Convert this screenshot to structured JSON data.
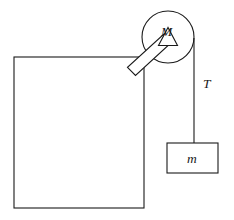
{
  "figure": {
    "kind": "physics-free-body-diagram",
    "background_color": "#ffffff",
    "stroke_color": "#1a1a1a"
  },
  "labels": {
    "pulley_mass": "M",
    "tension": "T",
    "hanging_mass": "m"
  },
  "geometry": {
    "canvas": {
      "width": 234,
      "height": 220
    },
    "large_block": {
      "x": 14,
      "y": 57,
      "width": 130,
      "height": 151
    },
    "pulley": {
      "cx": 168,
      "cy": 37,
      "r": 26
    },
    "axle_triangle": {
      "apex_x": 168,
      "apex_y": 29,
      "base_left_x": 158,
      "base_left_y": 45,
      "base_right_x": 178,
      "base_right_y": 45
    },
    "bracket_rod": {
      "from_x": 131,
      "from_y": 71,
      "to_x": 168,
      "to_y": 38,
      "thickness": 11
    },
    "rope": {
      "x": 194,
      "y_top": 40,
      "y_bottom": 143
    },
    "hanging_block": {
      "x": 167,
      "y": 143,
      "width": 51,
      "height": 30
    },
    "label_M_pos": {
      "x": 166,
      "y": 32
    },
    "label_T_pos": {
      "x": 203,
      "y": 85
    },
    "label_m_pos": {
      "x": 192,
      "y": 163
    }
  }
}
